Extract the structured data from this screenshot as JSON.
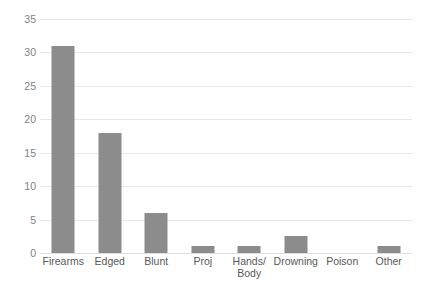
{
  "chart_data": {
    "type": "bar",
    "title": "",
    "subtitle": "",
    "xlabel": "",
    "ylabel": "",
    "categories": [
      "Firearms",
      "Edged",
      "Blunt",
      "Proj",
      "Hands/\nBody",
      "Drowning",
      "Poison",
      "Other"
    ],
    "values": [
      31,
      18,
      6,
      1,
      1,
      2.5,
      0,
      1
    ],
    "ylim": [
      0,
      35
    ],
    "yticks": [
      0,
      5,
      10,
      15,
      20,
      25,
      30,
      35
    ],
    "ytick_labels": [
      "0",
      "5",
      "10",
      "15",
      "20",
      "25",
      "30",
      "35"
    ],
    "grid": true,
    "grid_axis": "y",
    "legend": null,
    "legend_position": "none",
    "series": [
      {
        "name": "",
        "values": [
          31,
          18,
          6,
          1,
          1,
          2.5,
          0,
          1
        ]
      }
    ],
    "colors": {
      "bar": "#8c8c8c",
      "gridline": "#e8e8e8",
      "axis": "#dedede",
      "tick_text": "#7f7f7f",
      "category_text": "#595959",
      "background": "#ffffff"
    }
  }
}
